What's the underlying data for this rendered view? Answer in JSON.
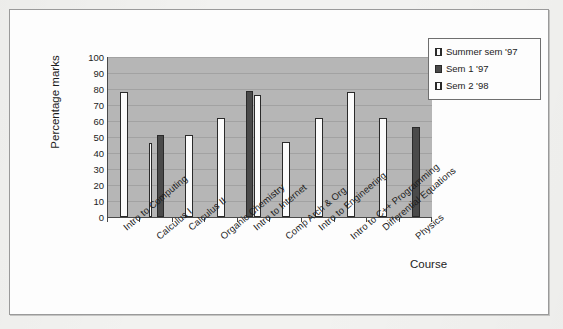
{
  "chart_data": {
    "type": "bar",
    "title": "",
    "xlabel": "Course",
    "ylabel": "Percentage marks",
    "ylim": [
      0,
      100
    ],
    "ytick_step": 10,
    "yticks": [
      100,
      90,
      80,
      70,
      60,
      50,
      40,
      30,
      20,
      10,
      0
    ],
    "grid": true,
    "legend_position": "top-right",
    "categories": [
      "Intro to Computing",
      "Calculus I",
      "Calculus II",
      "Organic Chemistry",
      "Intro to Internet",
      "Comp Arch & Org",
      "Intro to Engineering",
      "Intro to C++ Programming",
      "Differential Equations",
      "Physics"
    ],
    "series": [
      {
        "name": "Summer sem '97",
        "color": "#fbfbfb",
        "values": [
          78,
          46,
          null,
          null,
          null,
          null,
          null,
          null,
          null,
          null
        ]
      },
      {
        "name": "Sem 1 '97",
        "color": "#4a4a4a",
        "values": [
          null,
          51,
          null,
          null,
          79,
          null,
          null,
          null,
          null,
          56
        ]
      },
      {
        "name": "Sem 2 '98",
        "color": "#fbfbfb",
        "values": [
          null,
          null,
          51,
          62,
          76,
          47,
          62,
          78,
          62,
          null
        ]
      }
    ]
  },
  "legend": {
    "items": [
      {
        "label": "Summer sem '97",
        "swatch": "summer"
      },
      {
        "label": "Sem 1 '97",
        "swatch": "sem1"
      },
      {
        "label": "Sem 2 '98",
        "swatch": "sem2"
      }
    ]
  },
  "axes": {
    "y_title": "Percentage marks",
    "x_title": "Course"
  }
}
